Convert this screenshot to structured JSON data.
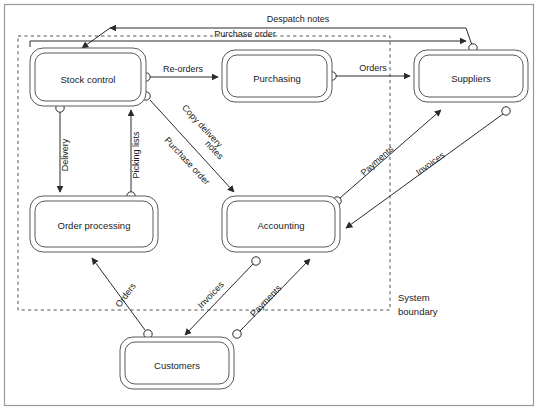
{
  "diagram": {
    "type": "data-flow-diagram",
    "colors": {
      "stroke": "#3c3c3c",
      "fill": "#ffffff",
      "text": "#1a1a1a",
      "boundary": "#555555",
      "frame": "#9a9a9a"
    },
    "frame": {
      "x": 4,
      "y": 4,
      "width": 530,
      "height": 402
    },
    "boundary": {
      "label_line1": "System",
      "label_line2": "boundary",
      "x": 18,
      "y": 36,
      "width": 372,
      "height": 274,
      "label_x": 398,
      "label_y": 300
    },
    "nodes": [
      {
        "id": "stock-control",
        "label": "Stock control",
        "x": 30,
        "y": 48,
        "width": 116,
        "height": 58
      },
      {
        "id": "purchasing",
        "label": "Purchasing",
        "x": 222,
        "y": 50,
        "width": 110,
        "height": 52
      },
      {
        "id": "suppliers",
        "label": "Suppliers",
        "x": 414,
        "y": 50,
        "width": 114,
        "height": 52
      },
      {
        "id": "order-processing",
        "label": "Order processing",
        "x": 30,
        "y": 196,
        "width": 128,
        "height": 56
      },
      {
        "id": "accounting",
        "label": "Accounting",
        "x": 222,
        "y": 196,
        "width": 118,
        "height": 56
      },
      {
        "id": "customers",
        "label": "Customers",
        "x": 120,
        "y": 337,
        "width": 114,
        "height": 52
      }
    ],
    "flows": [
      {
        "id": "despatch-notes",
        "label": "Despatch notes",
        "from": "suppliers",
        "to": "stock-control"
      },
      {
        "id": "purchase-order-top",
        "label": "Purchase order",
        "from": "stock-control",
        "to": "suppliers"
      },
      {
        "id": "re-orders",
        "label": "Re-orders",
        "from": "stock-control",
        "to": "purchasing"
      },
      {
        "id": "orders-supplier",
        "label": "Orders",
        "from": "purchasing",
        "to": "suppliers"
      },
      {
        "id": "delivery",
        "label": "Delivery",
        "from": "stock-control",
        "to": "order-processing"
      },
      {
        "id": "picking-lists",
        "label": "Picking lists",
        "from": "order-processing",
        "to": "stock-control"
      },
      {
        "id": "copy-delivery-notes",
        "label_line1": "Copy delivery",
        "label_line2": "notes",
        "from": "stock-control",
        "to": "accounting"
      },
      {
        "id": "purchase-order-diag",
        "label": "Purchase order",
        "from": "stock-control",
        "to": "accounting"
      },
      {
        "id": "payments-supplier",
        "label": "Payments",
        "from": "accounting",
        "to": "suppliers"
      },
      {
        "id": "invoices-supplier",
        "label": "Invoices",
        "from": "suppliers",
        "to": "accounting"
      },
      {
        "id": "orders-customer",
        "label": "Orders",
        "from": "customers",
        "to": "order-processing"
      },
      {
        "id": "invoices-customer",
        "label": "Invoices",
        "from": "accounting",
        "to": "customers"
      },
      {
        "id": "payments-customer",
        "label": "Payments",
        "from": "customers",
        "to": "accounting"
      }
    ]
  }
}
